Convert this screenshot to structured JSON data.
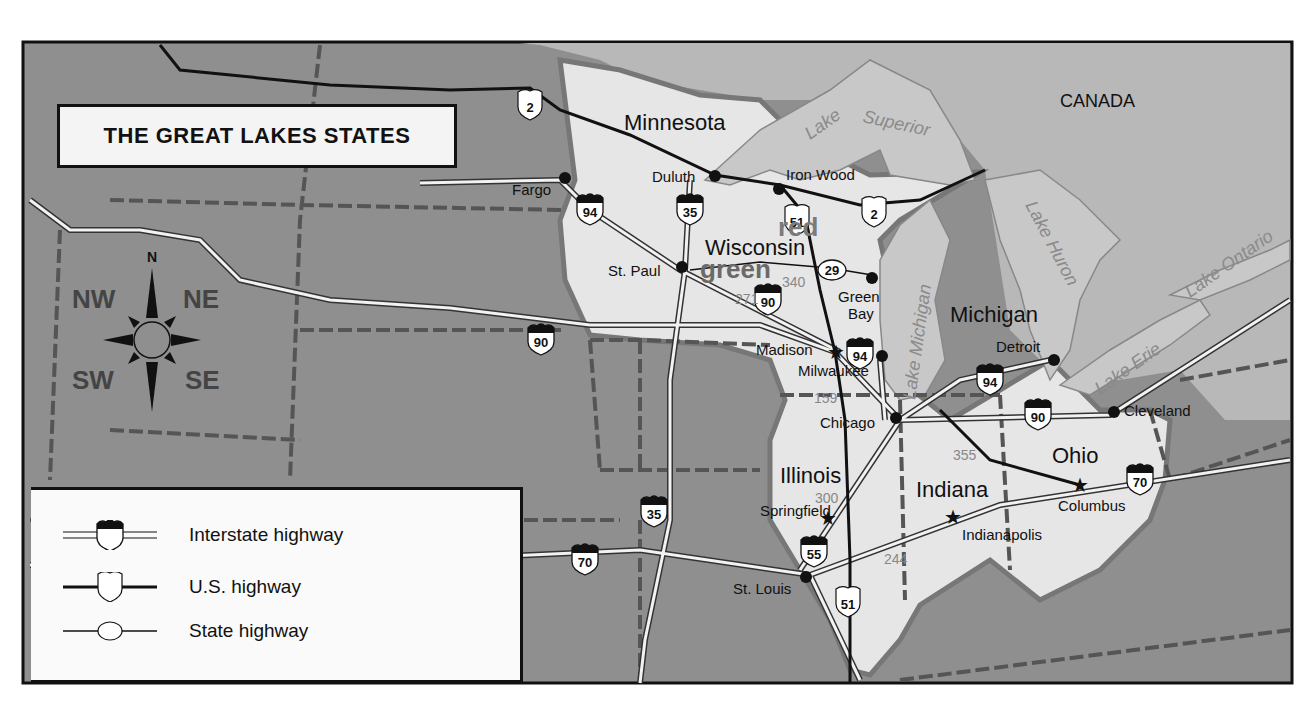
{
  "title": "THE GREAT LAKES STATES",
  "colors": {
    "background_outside": "#8f8f8f",
    "great_lakes_states": "#e6e6e6",
    "canada": "#b9b9b9",
    "lakes": "#c8c8c8",
    "frame": "#111111"
  },
  "country_label": "CANADA",
  "states": [
    {
      "name": "Minnesota"
    },
    {
      "name": "Wisconsin"
    },
    {
      "name": "Michigan"
    },
    {
      "name": "Illinois"
    },
    {
      "name": "Indiana"
    },
    {
      "name": "Ohio"
    }
  ],
  "lakes": [
    {
      "name": "Lake Superior"
    },
    {
      "name": "Lake Michigan"
    },
    {
      "name": "Lake Huron"
    },
    {
      "name": "Lake Erie"
    },
    {
      "name": "Lake Ontario"
    }
  ],
  "cities": [
    {
      "name": "Fargo",
      "type": "city"
    },
    {
      "name": "Duluth",
      "type": "city"
    },
    {
      "name": "Iron Wood",
      "type": "city"
    },
    {
      "name": "St. Paul",
      "type": "capital-dot"
    },
    {
      "name": "Green Bay",
      "type": "city"
    },
    {
      "name": "Madison",
      "type": "capital"
    },
    {
      "name": "Milwaukee",
      "type": "city"
    },
    {
      "name": "Detroit",
      "type": "city"
    },
    {
      "name": "Chicago",
      "type": "city"
    },
    {
      "name": "Cleveland",
      "type": "city"
    },
    {
      "name": "Springfield",
      "type": "capital"
    },
    {
      "name": "Indianapolis",
      "type": "capital"
    },
    {
      "name": "Columbus",
      "type": "capital"
    },
    {
      "name": "St. Louis",
      "type": "city"
    }
  ],
  "highway_shields": {
    "interstate": [
      "94",
      "35",
      "90",
      "94",
      "94",
      "90",
      "70",
      "35",
      "70",
      "55"
    ],
    "us": [
      "2",
      "51",
      "2",
      "51"
    ],
    "state": [
      "29"
    ]
  },
  "distance_labels": [
    "340",
    "271",
    "159",
    "355",
    "300",
    "244"
  ],
  "overlay_words": {
    "red": "red",
    "green": "green"
  },
  "compass": {
    "north": "N",
    "nw": "NW",
    "ne": "NE",
    "sw": "SW",
    "se": "SE"
  },
  "legend": {
    "items": [
      {
        "label": "Interstate highway",
        "symbol": "interstate-shield"
      },
      {
        "label": "U.S. highway",
        "symbol": "us-shield"
      },
      {
        "label": "State highway",
        "symbol": "state-oval"
      }
    ]
  }
}
